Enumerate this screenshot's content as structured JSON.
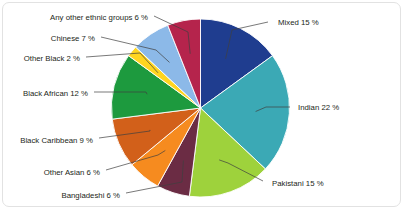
{
  "figure": {
    "background_color": "#ffffff",
    "border_color": "#e2e2e2",
    "label_color": "#231f20",
    "leader_line_color": "#3f3f3f"
  },
  "chart_data": {
    "type": "pie",
    "title": "",
    "subtitle": "",
    "xlabel": "",
    "ylabel": "",
    "legend_position": "none",
    "label_format": "{name} {value} %",
    "units": "%",
    "total": 100,
    "start_angle_deg": 0,
    "direction": "clockwise",
    "categories": [
      "Mixed",
      "Indian",
      "Pakistani",
      "Bangladeshi",
      "Other Asian",
      "Black Caribbean",
      "Black African",
      "Other Black",
      "Chinese",
      "Any other ethnic groups"
    ],
    "values": [
      15,
      22,
      15,
      6,
      6,
      9,
      12,
      2,
      7,
      6
    ],
    "colors": [
      "#1F3D8F",
      "#3BA9B5",
      "#9ED23C",
      "#6B2C44",
      "#F68B1F",
      "#D2601A",
      "#1D9A3E",
      "#FFD520",
      "#8CB9E8",
      "#B5244C"
    ],
    "slices": [
      {
        "label": "Mixed",
        "value": 15,
        "text": "Mixed 15 %",
        "color": "#1F3D8F"
      },
      {
        "label": "Indian",
        "value": 22,
        "text": "Indian 22 %",
        "color": "#3BA9B5"
      },
      {
        "label": "Pakistani",
        "value": 15,
        "text": "Pakistani 15 %",
        "color": "#9ED23C"
      },
      {
        "label": "Bangladeshi",
        "value": 6,
        "text": "Bangladeshi 6 %",
        "color": "#6B2C44"
      },
      {
        "label": "Other Asian",
        "value": 6,
        "text": "Other Asian 6 %",
        "color": "#F68B1F"
      },
      {
        "label": "Black Caribbean",
        "value": 9,
        "text": "Black Caribbean 9 %",
        "color": "#D2601A"
      },
      {
        "label": "Black African",
        "value": 12,
        "text": "Black African 12 %",
        "color": "#1D9A3E"
      },
      {
        "label": "Other Black",
        "value": 2,
        "text": "Other Black 2 %",
        "color": "#FFD520"
      },
      {
        "label": "Chinese",
        "value": 7,
        "text": "Chinese 7 %",
        "color": "#8CB9E8"
      },
      {
        "label": "Any other ethnic groups",
        "value": 6,
        "text": "Any other ethnic groups 6 %",
        "color": "#B5244C"
      }
    ]
  }
}
